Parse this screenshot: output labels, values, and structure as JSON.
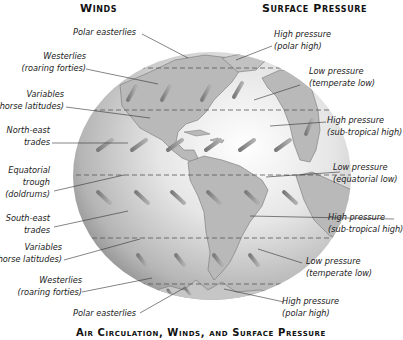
{
  "headings": {
    "winds": "Winds",
    "surface_pressure": "Surface Pressure",
    "caption": "Air Circulation, Winds, and Surface Pressure"
  },
  "wind_labels": [
    {
      "line1": "Polar easterlies",
      "line2": ""
    },
    {
      "line1": "Westerlies",
      "line2": "(roaring forties)"
    },
    {
      "line1": "Variables",
      "line2": "(horse latitudes)"
    },
    {
      "line1": "North-east",
      "line2": "trades"
    },
    {
      "line1": "Equatorial",
      "line2": "trough",
      "line3": "(doldrums)"
    },
    {
      "line1": "South-east",
      "line2": "trades"
    },
    {
      "line1": "Variables",
      "line2": "(horse latitudes)"
    },
    {
      "line1": "Westerlies",
      "line2": "(roaring forties)"
    },
    {
      "line1": "Polar easterlies",
      "line2": ""
    }
  ],
  "pressure_labels": [
    {
      "line1": "High pressure",
      "line2": "(polar high)"
    },
    {
      "line1": "Low pressure",
      "line2": "(temperate low)"
    },
    {
      "line1": "High pressure",
      "line2": "(sub-tropical high)"
    },
    {
      "line1": "Low pressure",
      "line2": "(equatorial low)"
    },
    {
      "line1": "High pressure",
      "line2": "(sub-tropical high)"
    },
    {
      "line1": "Low pressure",
      "line2": "(temperate low)"
    },
    {
      "line1": "High pressure",
      "line2": "(polar high)"
    }
  ],
  "colors": {
    "ocean_light": "#f4f4f4",
    "ocean_dark": "#9a9a9a",
    "land": "#b8b8b8",
    "arrow": "#8a8a8a",
    "leader_line": "#333333"
  }
}
